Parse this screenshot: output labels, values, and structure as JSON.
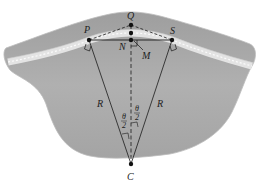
{
  "figure": {
    "colors": {
      "terrain": "#a9a9a9",
      "terrain_edge": "#bcbcbc",
      "road": "#e6e6e6",
      "road_dash": "#f7f7f7",
      "lines": "#1a1a1a",
      "points": "#111111"
    },
    "points": {
      "Q": "Q",
      "P": "P",
      "S": "S",
      "N": "N",
      "M": "M",
      "C": "C"
    },
    "radius_labels": {
      "left": "R",
      "right": "R"
    },
    "angle_labels": {
      "left": {
        "num": "θ",
        "den": "2"
      },
      "right": {
        "num": "θ",
        "den": "2"
      }
    }
  }
}
